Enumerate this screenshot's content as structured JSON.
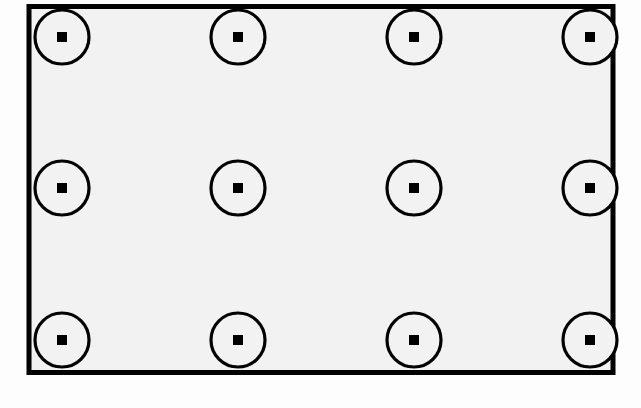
{
  "diagram": {
    "type": "technical-drawing",
    "canvas": {
      "width": 641,
      "height": 408,
      "background_color": "#fdfdfd"
    },
    "colors": {
      "stroke": "#000000",
      "plate_fill": "#f2f2f2",
      "marker_fill": "#f2f2f2",
      "marker_center_fill": "#000000",
      "page_background": "#fdfdfd"
    },
    "plate": {
      "name": "rectangle-plate",
      "x": 29,
      "y": 6.5,
      "width": 584,
      "height": 366,
      "stroke_width": 5,
      "fill": "#f2f2f2"
    },
    "marker": {
      "circle_diameter": 54,
      "circle_radius": 27,
      "circle_stroke_width": 3.2,
      "center_square_size": 10
    },
    "grid": {
      "columns": 4,
      "rows": 3,
      "column_x": [
        62,
        238,
        414,
        590
      ],
      "row_y": [
        37,
        188,
        340
      ],
      "column_spacing": 176,
      "row_spacing": 151.5,
      "count": 12
    },
    "markers": [
      {
        "id": "marker-r1-c1",
        "row": 1,
        "col": 1,
        "cx": 62,
        "cy": 37
      },
      {
        "id": "marker-r1-c2",
        "row": 1,
        "col": 2,
        "cx": 238,
        "cy": 37
      },
      {
        "id": "marker-r1-c3",
        "row": 1,
        "col": 3,
        "cx": 414,
        "cy": 37
      },
      {
        "id": "marker-r1-c4",
        "row": 1,
        "col": 4,
        "cx": 590,
        "cy": 37
      },
      {
        "id": "marker-r2-c1",
        "row": 2,
        "col": 1,
        "cx": 62,
        "cy": 188
      },
      {
        "id": "marker-r2-c2",
        "row": 2,
        "col": 2,
        "cx": 238,
        "cy": 188
      },
      {
        "id": "marker-r2-c3",
        "row": 2,
        "col": 3,
        "cx": 414,
        "cy": 188
      },
      {
        "id": "marker-r2-c4",
        "row": 2,
        "col": 4,
        "cx": 590,
        "cy": 188
      },
      {
        "id": "marker-r3-c1",
        "row": 3,
        "col": 1,
        "cx": 62,
        "cy": 340
      },
      {
        "id": "marker-r3-c2",
        "row": 3,
        "col": 2,
        "cx": 238,
        "cy": 340
      },
      {
        "id": "marker-r3-c3",
        "row": 3,
        "col": 3,
        "cx": 414,
        "cy": 340
      },
      {
        "id": "marker-r3-c4",
        "row": 3,
        "col": 4,
        "cx": 590,
        "cy": 340
      }
    ]
  }
}
